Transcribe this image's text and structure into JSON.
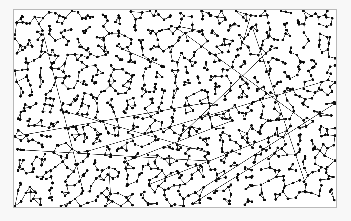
{
  "figure": {
    "title": "",
    "background_color": "#f8f8f8",
    "plot_background_color": "#ffffff",
    "frame_color": "#b9b9b9",
    "frame": {
      "x": 13,
      "y": 9,
      "width": 324,
      "height": 199
    }
  },
  "chart_data": {
    "type": "scatter",
    "title": "",
    "subtitle": "",
    "xlabel": "",
    "ylabel": "",
    "xlim": [
      0,
      324
    ],
    "ylim": [
      0,
      199
    ],
    "grid": false,
    "legend": null,
    "tick_labels_x": [],
    "tick_labels_y": [],
    "annotations": [],
    "series": [
      {
        "name": "nodes",
        "type": "scatter",
        "marker": "circle",
        "marker_color": "#0a0a0a",
        "marker_size_px": 2.6,
        "count": 1150,
        "distribution": "uniform-random",
        "seed": 20240517
      },
      {
        "name": "edges",
        "type": "line-segments",
        "line_color": "#222222",
        "line_width_px": 0.55,
        "neighbors_per_node": 2,
        "long_edge_count": 16,
        "description": "k-nearest-neighbour links plus a small number of long straight crossing lines"
      }
    ]
  }
}
